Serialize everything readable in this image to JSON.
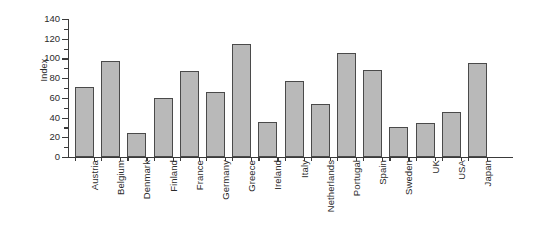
{
  "chart_data": {
    "type": "bar",
    "title": "",
    "subtitle": "",
    "xlabel": "",
    "ylabel": "Index",
    "ylim": [
      0,
      140
    ],
    "ytick_values": [
      0,
      20,
      40,
      60,
      80,
      100,
      120,
      140
    ],
    "ytick_labels": [
      "0",
      "20",
      "40",
      "60",
      "80",
      "100",
      "120",
      "140"
    ],
    "yminor_step": 10,
    "grid": false,
    "legend": false,
    "legend_position": "none",
    "categories": [
      "Austria",
      "Belgium",
      "Denmark",
      "Finland",
      "France",
      "Germany",
      "Greece",
      "Ireland",
      "Italy",
      "Netherlands",
      "Portugal",
      "Spain",
      "Sweden",
      "UK",
      "USA",
      "Japan"
    ],
    "values": [
      71,
      97,
      24,
      60,
      87,
      66,
      115,
      36,
      77,
      54,
      106,
      88,
      30,
      35,
      46,
      95
    ],
    "bar_fill_color": "#b9b9b9",
    "bar_edge_color": "#4a4a4a",
    "axis_color": "#3a3a3a",
    "background_color": "#ffffff"
  }
}
